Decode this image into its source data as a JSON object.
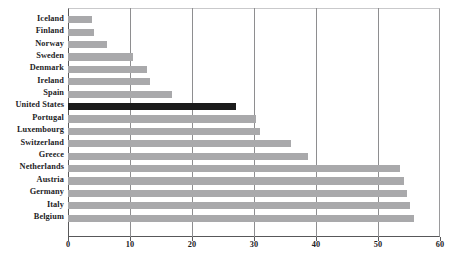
{
  "chart_data": {
    "type": "bar",
    "orientation": "horizontal",
    "title": "",
    "subtitle": "",
    "xlabel": "",
    "ylabel": "",
    "xlim": [
      0,
      60
    ],
    "xticks": [
      0,
      10,
      20,
      30,
      40,
      50,
      60
    ],
    "xtick_labels": [
      "0",
      "10",
      "20",
      "30",
      "40",
      "50",
      "60"
    ],
    "grid": "vertical",
    "legend": "none",
    "categories": [
      "Iceland",
      "Finland",
      "Norway",
      "Sweden",
      "Denmark",
      "Ireland",
      "Spain",
      "United States",
      "Portugal",
      "Luxembourg",
      "Switzerland",
      "Greece",
      "Netherlands",
      "Austria",
      "Germany",
      "Italy",
      "Belgium"
    ],
    "values": [
      3.9,
      4.2,
      6.3,
      10.5,
      12.7,
      13.2,
      16.8,
      27.1,
      30.3,
      31.0,
      36.0,
      38.7,
      53.5,
      54.2,
      54.7,
      55.2,
      55.8
    ],
    "highlight_category": "United States",
    "colors": {
      "bar": "#a9a9ab",
      "bar_highlight": "#1b1b1b",
      "axis": "#58585a",
      "gridline": "#8e8e90",
      "text": "#1d1d1f",
      "background": "#ffffff"
    }
  }
}
